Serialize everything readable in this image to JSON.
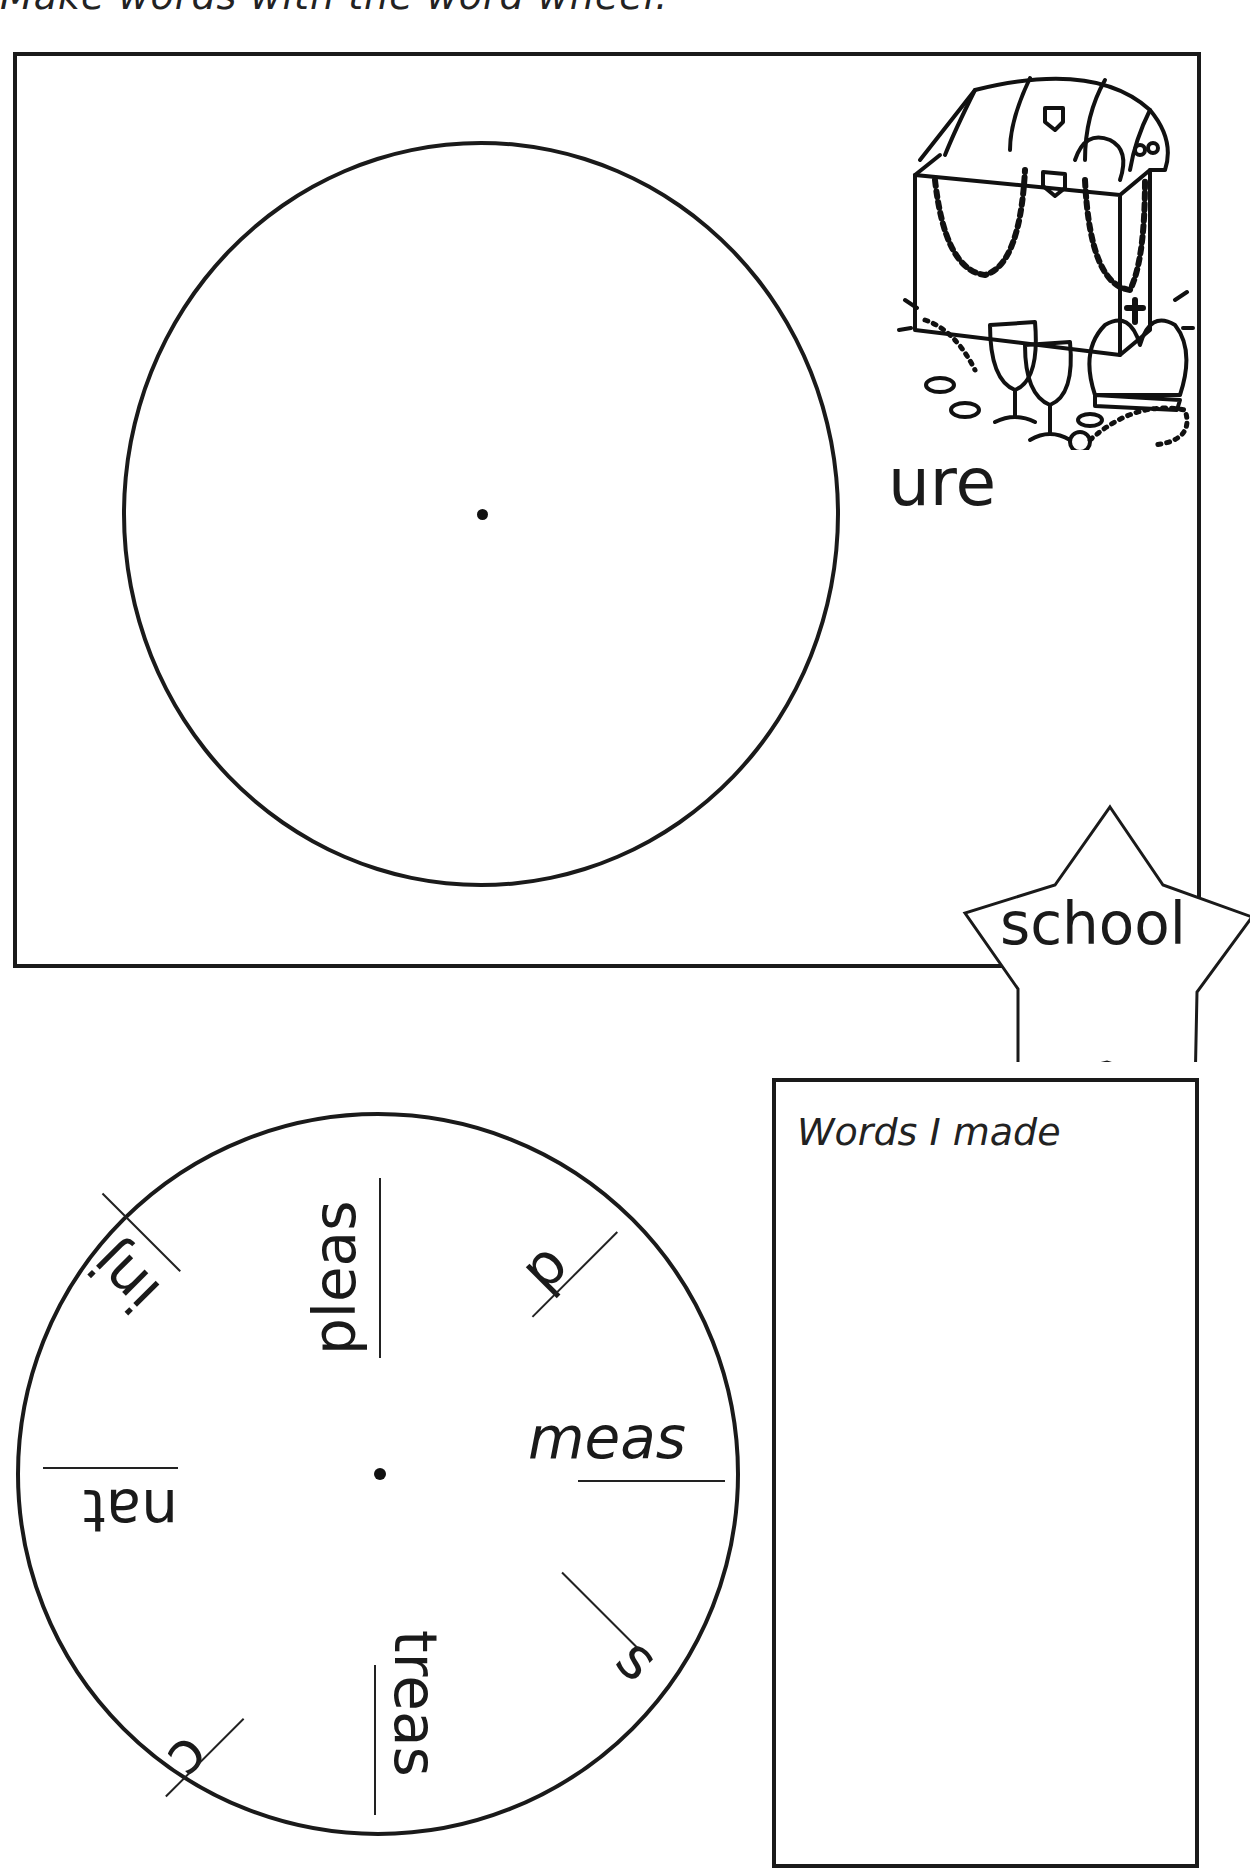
{
  "instruction": "Make words with the word wheel.",
  "upper_panel": {
    "suffix": "ure",
    "illustration": "treasure-chest-icon",
    "illustration_parts": [
      "treasure chest",
      "pearl necklaces",
      "goblets",
      "crown",
      "coins",
      "pendant"
    ]
  },
  "star": {
    "word": "school"
  },
  "words_box": {
    "title": "Words I made"
  },
  "lower_wheel": {
    "segments": [
      {
        "text": "pleas",
        "angle": -90,
        "word": "pleasure"
      },
      {
        "text": "p",
        "angle": -45,
        "word": "pure"
      },
      {
        "text": "meas",
        "angle": 0,
        "word": "measure"
      },
      {
        "text": "s",
        "angle": 45,
        "word": "sure"
      },
      {
        "text": "treas",
        "angle": 90,
        "word": "treasure"
      },
      {
        "text": "c",
        "angle": 135,
        "word": "cure"
      },
      {
        "text": "nat",
        "angle": 180,
        "word": "nature"
      },
      {
        "text": "inj",
        "angle": -135,
        "word": "injure"
      }
    ]
  },
  "colors": {
    "ink": "#1a1a1a",
    "paper": "#ffffff"
  }
}
